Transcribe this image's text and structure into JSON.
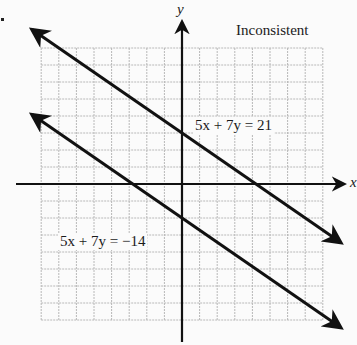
{
  "title": "Inconsistent",
  "axes": {
    "x_label": "x",
    "y_label": "y"
  },
  "equations": [
    {
      "label": "5x + 7y = 21",
      "a": 5,
      "b": 7,
      "c": 21
    },
    {
      "label": "5x + 7y = −14",
      "a": 5,
      "b": 7,
      "c": -14
    }
  ],
  "chart_data": {
    "type": "line",
    "title": "Inconsistent",
    "xlabel": "x",
    "ylabel": "y",
    "xlim": [
      -8,
      8
    ],
    "ylim": [
      -8,
      8
    ],
    "grid": true,
    "series": [
      {
        "name": "5x + 7y = 21",
        "x": [
          -8.5,
          9
        ],
        "y": [
          9.07,
          -3.43
        ]
      },
      {
        "name": "5x + 7y = -14",
        "x": [
          -8.5,
          9
        ],
        "y": [
          4.07,
          -8.43
        ]
      }
    ]
  },
  "colors": {
    "line": "#111111",
    "grid": "#b8b8b8",
    "background": "#fbfbfb"
  }
}
